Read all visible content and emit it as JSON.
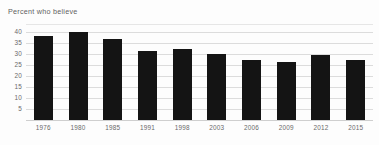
{
  "chart_data": {
    "type": "bar",
    "title": "Percent who believe",
    "xlabel": "",
    "ylabel": "",
    "categories": [
      "1976",
      "1980",
      "1985",
      "1991",
      "1998",
      "2003",
      "2006",
      "2009",
      "2012",
      "2015"
    ],
    "values": [
      38,
      40,
      37,
      31.5,
      32.5,
      30,
      27.5,
      26.3,
      29.5,
      27.3
    ],
    "ylim": [
      0,
      40
    ],
    "yticks": [
      40,
      35,
      30,
      25,
      20,
      15,
      10,
      5
    ],
    "ytick_labels": [
      "40",
      "35",
      "30",
      "25",
      "20",
      "15",
      "10",
      "5"
    ],
    "grid": true,
    "legend": null,
    "bar_color": "#141414",
    "gridline_color": "#dcdcdc",
    "text_color": "#6a6a6a",
    "background_color": "#fdfdfd"
  }
}
